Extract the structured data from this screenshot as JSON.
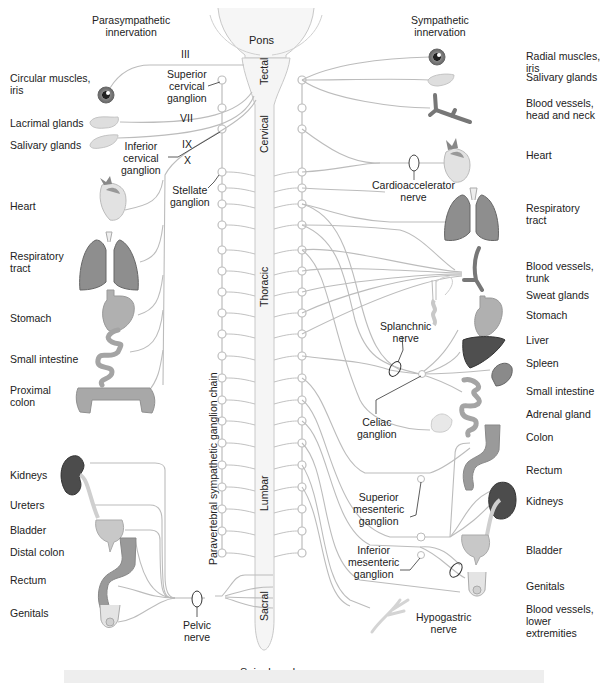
{
  "headers": {
    "parasympathetic": "Parasympathetic\ninnervation",
    "sympathetic": "Sympathetic\ninnervation"
  },
  "cns": {
    "pons": "Pons",
    "spinal_cord": "Spinal cord",
    "segments": [
      "Tectal",
      "Cervical",
      "Thoracic",
      "Lumbar",
      "Sacral"
    ],
    "chain_label": "Paravertebral sympathetic ganglion chain"
  },
  "cranial_nerves": [
    "III",
    "VII",
    "IX",
    "X"
  ],
  "ganglia_labels": {
    "superior_cervical": "Superior\ncervical\nganglion",
    "inferior_cervical": "Inferior\ncervical\nganglion",
    "stellate": "Stellate\nganglion",
    "celiac": "Celiac\nganglion",
    "superior_mesenteric": "Superior\nmesenteric\nganglion",
    "inferior_mesenteric": "Inferior\nmesenteric\nganglion"
  },
  "nerve_labels": {
    "cardioaccelerator": "Cardioaccelerator\nnerve",
    "splanchnic": "Splanchnic\nnerve",
    "pelvic": "Pelvic\nnerve",
    "hypogastric": "Hypogastric\nnerve"
  },
  "left_targets": [
    "Circular muscles,\niris",
    "Lacrimal glands",
    "Salivary glands",
    "Heart",
    "Respiratory\ntract",
    "Stomach",
    "Small intestine",
    "Proximal\ncolon",
    "Kidneys",
    "Ureters",
    "Bladder",
    "Distal colon",
    "Rectum",
    "Genitals"
  ],
  "right_targets": [
    "Radial muscles,\niris",
    "Salivary glands",
    "Blood vessels,\nhead and neck",
    "Heart",
    "Respiratory\ntract",
    "Blood vessels,\ntrunk",
    "Sweat glands",
    "Stomach",
    "Liver",
    "Spleen",
    "Small intestine",
    "Adrenal gland",
    "Colon",
    "Rectum",
    "Kidneys",
    "Bladder",
    "Genitals",
    "Blood vessels,\nlower\nextremities"
  ],
  "colors": {
    "nerve": "#b8b8b8",
    "cord_fill": "#f4f4f4",
    "organ_light": "#d6d6d6",
    "organ_mid": "#9a9a9a",
    "organ_dark": "#555555"
  }
}
